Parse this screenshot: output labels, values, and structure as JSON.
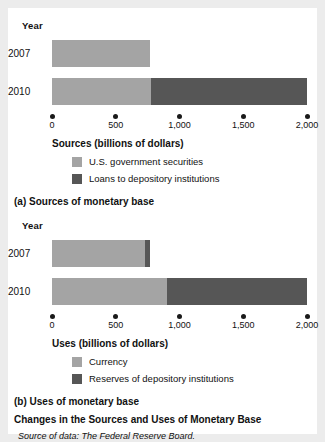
{
  "figure": {
    "title": "Changes in the Sources and Uses of Monetary Base",
    "source_note": "Source of data: The Federal Reserve Board."
  },
  "panel_a": {
    "caption": "(a) Sources of monetary base",
    "year_header": "Year",
    "axis_title": "Sources (billions of dollars)",
    "rows": [
      "2007",
      "2010"
    ],
    "legend": [
      {
        "label": "U.S. government securities",
        "color": "#a4a4a4"
      },
      {
        "label": "Loans to depository institutions",
        "color": "#565656"
      }
    ]
  },
  "panel_b": {
    "caption": "(b) Uses of monetary base",
    "year_header": "Year",
    "axis_title": "Uses (billions of dollars)",
    "rows": [
      "2007",
      "2010"
    ],
    "legend": [
      {
        "label": "Currency",
        "color": "#a4a4a4"
      },
      {
        "label": "Reserves of depository institutions",
        "color": "#565656"
      }
    ]
  },
  "ticks": {
    "values": [
      0,
      500,
      1000,
      1500,
      2000
    ],
    "labels": [
      "0",
      "500",
      "1,000",
      "1,500",
      "2,000"
    ]
  },
  "chart_data": [
    {
      "type": "bar",
      "orientation": "horizontal",
      "stacked": true,
      "title": "(a) Sources of monetary base",
      "xlabel": "Sources (billions of dollars)",
      "ylabel": "Year",
      "categories": [
        "2007",
        "2010"
      ],
      "series": [
        {
          "name": "U.S. government securities",
          "color": "#a4a4a4",
          "values": [
            770,
            775
          ]
        },
        {
          "name": "Loans to depository institutions",
          "color": "#565656",
          "values": [
            0,
            1225
          ]
        }
      ],
      "totals": [
        770,
        2000
      ],
      "xlim": [
        0,
        2000
      ],
      "xticks": [
        0,
        500,
        1000,
        1500,
        2000
      ],
      "xticklabels": [
        "0",
        "500",
        "1,000",
        "1,500",
        "2,000"
      ],
      "grid": false,
      "legend_position": "below-axis"
    },
    {
      "type": "bar",
      "orientation": "horizontal",
      "stacked": true,
      "title": "(b) Uses of monetary base",
      "xlabel": "Uses (billions of dollars)",
      "ylabel": "Year",
      "categories": [
        "2007",
        "2010"
      ],
      "series": [
        {
          "name": "Currency",
          "color": "#a4a4a4",
          "values": [
            730,
            900
          ]
        },
        {
          "name": "Reserves of depository institutions",
          "color": "#565656",
          "values": [
            40,
            1100
          ]
        }
      ],
      "totals": [
        770,
        2000
      ],
      "xlim": [
        0,
        2000
      ],
      "xticks": [
        0,
        500,
        1000,
        1500,
        2000
      ],
      "xticklabels": [
        "0",
        "500",
        "1,000",
        "1,500",
        "2,000"
      ],
      "grid": false,
      "legend_position": "below-axis"
    }
  ]
}
